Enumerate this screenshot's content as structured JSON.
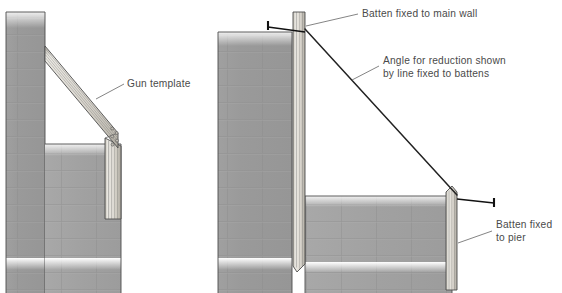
{
  "diagram": {
    "background_color": "#ffffff",
    "panels": [
      {
        "id": "left",
        "name": "gun-template-view",
        "labels": [
          {
            "id": "gun-template",
            "text": "Gun template",
            "lines": [
              "Gun template"
            ],
            "x": 127,
            "y": 87,
            "leader_from": [
              124,
              84
            ],
            "leader_to": [
              96,
              99
            ]
          }
        ]
      },
      {
        "id": "right",
        "name": "batten-and-line-view",
        "labels": [
          {
            "id": "batten-main-wall",
            "text": "Batten fixed to main wall",
            "lines": [
              "Batten fixed to main wall"
            ],
            "x": 362,
            "y": 17,
            "leader_from": [
              358,
              14
            ],
            "leader_to": [
              306,
              26
            ]
          },
          {
            "id": "angle-for-reduction",
            "text": "Angle for reduction shown by line fixed to battens",
            "lines": [
              "Angle for reduction shown",
              "by line fixed to battens"
            ],
            "x": 383,
            "y": 64,
            "leader_from": [
              379,
              66
            ],
            "leader_to": [
              352,
              80
            ]
          },
          {
            "id": "batten-pier",
            "text": "Batten fixed to pier",
            "lines": [
              "Batten fixed",
              "to pier"
            ],
            "x": 496,
            "y": 228,
            "leader_from": [
              492,
              231
            ],
            "leader_to": [
              458,
              243
            ]
          }
        ]
      }
    ],
    "colors": {
      "blockwork_fill": "#9b9b9b",
      "blockwork_fill_light": "#a6a6a6",
      "outline": "#4d4d4d",
      "mortar_joint": "#9a9a9a",
      "timber_light": "#e6e4de",
      "timber_mid": "#cfccc4",
      "timber_shadow": "#b6b2a8",
      "line_black": "#1a1a1a",
      "label_text": "#4a4a4a",
      "leader": "#6e6e6e"
    },
    "elements": {
      "left_main_wall": "main-wall-blockwork",
      "left_pier_wall": "pier-blockwork",
      "left_gun_template": "gun-template-timber",
      "right_main_wall": "main-wall-blockwork",
      "right_pier_wall": "pier-blockwork",
      "right_main_batten": "vertical-batten-timber",
      "right_pier_batten": "pier-batten-timber",
      "right_line": "string-line",
      "fixings": [
        "nail-top",
        "nail-pier"
      ]
    }
  }
}
